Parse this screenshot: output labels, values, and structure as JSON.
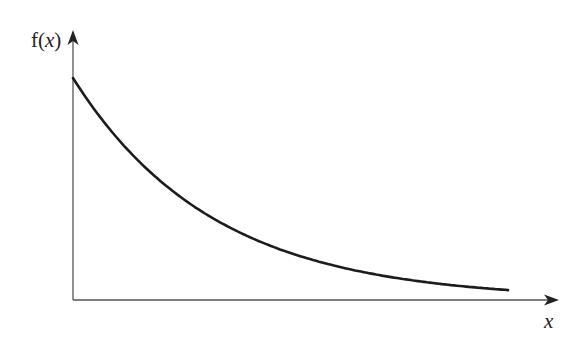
{
  "chart_data": {
    "type": "line",
    "title": "",
    "xlabel": "x",
    "ylabel": "f(x)",
    "ylabel_parts": {
      "prefix": "f(",
      "var": "x",
      "suffix": ")"
    },
    "grid": false,
    "legend": null,
    "ticks": {
      "x": [],
      "y": []
    },
    "function_form": "f(x) = A * exp(-k x)",
    "series": [
      {
        "name": "f(x)",
        "color": "#1c1c1c",
        "x": [
          0,
          0.1,
          0.2,
          0.3,
          0.4,
          0.5,
          0.6,
          0.7,
          0.8,
          0.9,
          1.0
        ],
        "values": [
          1.0,
          0.73,
          0.54,
          0.39,
          0.29,
          0.21,
          0.16,
          0.11,
          0.08,
          0.06,
          0.04
        ]
      }
    ],
    "xlim": [
      0,
      1.1
    ],
    "ylim": [
      0,
      1.2
    ]
  },
  "layout_px": {
    "origin": [
      73,
      300
    ],
    "x_axis_end": 557,
    "y_axis_top": 32,
    "curve_start": [
      73,
      78
    ],
    "curve_end_x": 508,
    "decay_k_per_px": 0.00714
  },
  "colors": {
    "background": "#ffffff",
    "axis": "#555555",
    "curve": "#1c1c1c",
    "text": "#222222"
  }
}
